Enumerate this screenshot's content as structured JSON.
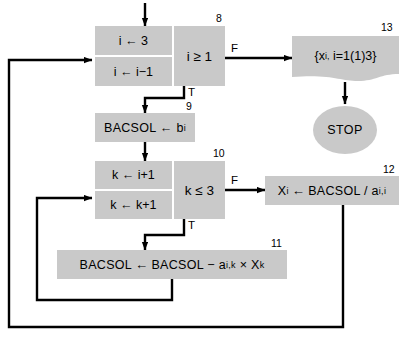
{
  "diagram": {
    "fill_color": "#c9c9c9",
    "line_color": "#000000",
    "background": "#ffffff"
  },
  "nodes": {
    "box8": {
      "number": "8",
      "init": "i ← 3",
      "increment": "i ← i−1",
      "test": "i ≥ 1",
      "true_label": "T",
      "false_label": "F"
    },
    "box9": {
      "number": "9",
      "text": "BACSOL ← b",
      "subscript": "i"
    },
    "box10": {
      "number": "10",
      "init": "k ← i+1",
      "increment": "k ← k+1",
      "test": "k ≤ 3",
      "true_label": "T",
      "false_label": "F"
    },
    "box11": {
      "number": "11",
      "lhs": "BACSOL",
      "arrow": "←",
      "rhs_a": "BACSOL − a",
      "rhs_a_sub": "i,k",
      "rhs_times": "× X",
      "rhs_x_sub": "k"
    },
    "box12": {
      "number": "12",
      "lhs": "X",
      "lhs_sub": "i",
      "arrow": "←",
      "rhs": "BACSOL / a",
      "rhs_sub": "i,i"
    },
    "box13": {
      "number": "13",
      "text": "{x",
      "text_sub": "i,",
      "text_rest": "i=1(1)3}"
    },
    "stop": {
      "label": "STOP"
    }
  }
}
